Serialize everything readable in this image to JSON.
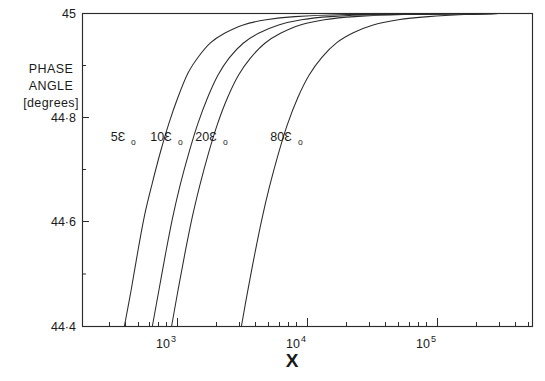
{
  "chart_data": {
    "type": "line",
    "title": "",
    "xlabel": "X",
    "ylabel": "PHASE ANGLE [degrees]",
    "ylabel_lines": [
      "PHASE",
      "ANGLE",
      "[degrees]"
    ],
    "xscale": "log",
    "yscale": "linear",
    "xlim": [
      380,
      300000
    ],
    "ylim": [
      44.4,
      45.0
    ],
    "grid": false,
    "legend": "inline-curve-labels",
    "x_tick_labels": [
      "10",
      "10",
      "10"
    ],
    "x_tick_exponents": [
      "3",
      "4",
      "5"
    ],
    "x_tick_values": [
      1000,
      10000,
      100000
    ],
    "y_tick_labels": [
      "45",
      "44·8",
      "44·6",
      "44·4"
    ],
    "y_tick_values": [
      45.0,
      44.8,
      44.6,
      44.4
    ],
    "y_minor_tick_values": [
      44.9,
      44.7,
      44.5
    ],
    "series": [
      {
        "name": "5ε₀",
        "label_text": "5Ɛ",
        "label_sub": "o",
        "points": [
          [
            390,
            44.4
          ],
          [
            440,
            44.47
          ],
          [
            500,
            44.55
          ],
          [
            560,
            44.615
          ],
          [
            640,
            44.675
          ],
          [
            740,
            44.735
          ],
          [
            860,
            44.79
          ],
          [
            1010,
            44.84
          ],
          [
            1200,
            44.885
          ],
          [
            1450,
            44.917
          ],
          [
            1800,
            44.944
          ],
          [
            2300,
            44.962
          ],
          [
            3200,
            44.978
          ],
          [
            4800,
            44.988
          ],
          [
            8000,
            44.994
          ],
          [
            20000,
            44.998
          ],
          [
            60000,
            44.999
          ],
          [
            300000,
            45.0
          ]
        ]
      },
      {
        "name": "10ε₀",
        "label_text": "10Ɛ",
        "label_sub": "o",
        "points": [
          [
            640,
            44.4
          ],
          [
            720,
            44.47
          ],
          [
            810,
            44.54
          ],
          [
            920,
            44.61
          ],
          [
            1050,
            44.672
          ],
          [
            1220,
            44.732
          ],
          [
            1430,
            44.788
          ],
          [
            1700,
            44.838
          ],
          [
            2050,
            44.882
          ],
          [
            2500,
            44.915
          ],
          [
            3200,
            44.943
          ],
          [
            4200,
            44.962
          ],
          [
            6000,
            44.978
          ],
          [
            9000,
            44.988
          ],
          [
            15000,
            44.994
          ],
          [
            35000,
            44.998
          ],
          [
            100000,
            44.999
          ],
          [
            300000,
            45.0
          ]
        ]
      },
      {
        "name": "20ε₀",
        "label_text": "20Ɛ",
        "label_sub": "o",
        "points": [
          [
            900,
            44.4
          ],
          [
            1010,
            44.47
          ],
          [
            1140,
            44.54
          ],
          [
            1300,
            44.61
          ],
          [
            1490,
            44.672
          ],
          [
            1730,
            44.732
          ],
          [
            2030,
            44.788
          ],
          [
            2420,
            44.838
          ],
          [
            2950,
            44.882
          ],
          [
            3650,
            44.915
          ],
          [
            4700,
            44.943
          ],
          [
            6200,
            44.962
          ],
          [
            8800,
            44.978
          ],
          [
            13500,
            44.988
          ],
          [
            23000,
            44.994
          ],
          [
            55000,
            44.998
          ],
          [
            150000,
            44.999
          ],
          [
            300000,
            45.0
          ]
        ]
      },
      {
        "name": "80ε₀",
        "label_text": "80Ɛ",
        "label_sub": "o",
        "points": [
          [
            3100,
            44.4
          ],
          [
            3450,
            44.465
          ],
          [
            3900,
            44.535
          ],
          [
            4450,
            44.605
          ],
          [
            5100,
            44.668
          ],
          [
            5950,
            44.73
          ],
          [
            7000,
            44.787
          ],
          [
            8400,
            44.838
          ],
          [
            10300,
            44.882
          ],
          [
            12900,
            44.916
          ],
          [
            16800,
            44.944
          ],
          [
            22500,
            44.963
          ],
          [
            32000,
            44.978
          ],
          [
            50000,
            44.988
          ],
          [
            85000,
            44.994
          ],
          [
            160000,
            44.998
          ],
          [
            260000,
            44.999
          ],
          [
            300000,
            45.0
          ]
        ]
      }
    ],
    "curve_label_positions": [
      {
        "series": "5ε₀",
        "x_px": 118,
        "y_px": 140
      },
      {
        "series": "10ε₀",
        "x_px": 158,
        "y_px": 140
      },
      {
        "series": "20ε₀",
        "x_px": 202,
        "y_px": 140
      },
      {
        "series": "80ε₀",
        "x_px": 277,
        "y_px": 140
      }
    ],
    "colors": {
      "curve": "#2b2b2b",
      "axis": "#2b2b2b",
      "background": "#ffffff",
      "text": "#1a1a1a"
    }
  }
}
